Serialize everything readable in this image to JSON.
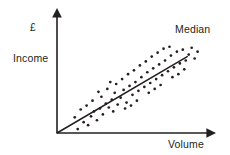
{
  "chart_data": {
    "type": "scatter",
    "title": "",
    "xlabel": "Volume",
    "ylabel": "Income",
    "ylabel_unit": "£",
    "annotations": [
      {
        "name": "median-line-label",
        "text": "Median"
      }
    ],
    "axis_style": "arrow",
    "grid": false,
    "legend": "none",
    "xlim": [
      0,
      100
    ],
    "ylim": [
      0,
      100
    ],
    "trendline": {
      "name": "Median",
      "type": "line",
      "x": [
        0,
        88
      ],
      "y": [
        0,
        78
      ]
    },
    "points": [
      {
        "x": 14,
        "y": 4
      },
      {
        "x": 18,
        "y": 11
      },
      {
        "x": 21,
        "y": 8
      },
      {
        "x": 23,
        "y": 17
      },
      {
        "x": 25,
        "y": 22
      },
      {
        "x": 27,
        "y": 13
      },
      {
        "x": 12,
        "y": 16
      },
      {
        "x": 16,
        "y": 24
      },
      {
        "x": 20,
        "y": 28
      },
      {
        "x": 29,
        "y": 25
      },
      {
        "x": 31,
        "y": 19
      },
      {
        "x": 33,
        "y": 30
      },
      {
        "x": 24,
        "y": 33
      },
      {
        "x": 30,
        "y": 37
      },
      {
        "x": 35,
        "y": 26
      },
      {
        "x": 37,
        "y": 34
      },
      {
        "x": 39,
        "y": 41
      },
      {
        "x": 41,
        "y": 29
      },
      {
        "x": 34,
        "y": 45
      },
      {
        "x": 43,
        "y": 36
      },
      {
        "x": 45,
        "y": 44
      },
      {
        "x": 47,
        "y": 31
      },
      {
        "x": 40,
        "y": 50
      },
      {
        "x": 49,
        "y": 48
      },
      {
        "x": 51,
        "y": 39
      },
      {
        "x": 44,
        "y": 55
      },
      {
        "x": 53,
        "y": 52
      },
      {
        "x": 55,
        "y": 43
      },
      {
        "x": 48,
        "y": 60
      },
      {
        "x": 57,
        "y": 57
      },
      {
        "x": 59,
        "y": 47
      },
      {
        "x": 52,
        "y": 64
      },
      {
        "x": 61,
        "y": 62
      },
      {
        "x": 63,
        "y": 51
      },
      {
        "x": 56,
        "y": 69
      },
      {
        "x": 65,
        "y": 66
      },
      {
        "x": 67,
        "y": 55
      },
      {
        "x": 60,
        "y": 73
      },
      {
        "x": 69,
        "y": 70
      },
      {
        "x": 71,
        "y": 59
      },
      {
        "x": 64,
        "y": 78
      },
      {
        "x": 73,
        "y": 74
      },
      {
        "x": 75,
        "y": 63
      },
      {
        "x": 68,
        "y": 82
      },
      {
        "x": 77,
        "y": 79
      },
      {
        "x": 79,
        "y": 67
      },
      {
        "x": 72,
        "y": 86
      },
      {
        "x": 81,
        "y": 83
      },
      {
        "x": 83,
        "y": 71
      },
      {
        "x": 76,
        "y": 88
      },
      {
        "x": 85,
        "y": 85
      },
      {
        "x": 87,
        "y": 74
      },
      {
        "x": 89,
        "y": 80
      },
      {
        "x": 91,
        "y": 87
      },
      {
        "x": 93,
        "y": 76
      },
      {
        "x": 95,
        "y": 83
      },
      {
        "x": 38,
        "y": 22
      },
      {
        "x": 46,
        "y": 25
      },
      {
        "x": 54,
        "y": 33
      },
      {
        "x": 62,
        "y": 41
      },
      {
        "x": 70,
        "y": 49
      },
      {
        "x": 78,
        "y": 57
      },
      {
        "x": 86,
        "y": 65
      },
      {
        "x": 28,
        "y": 42
      },
      {
        "x": 36,
        "y": 52
      },
      {
        "x": 50,
        "y": 28
      },
      {
        "x": 66,
        "y": 45
      },
      {
        "x": 82,
        "y": 60
      }
    ],
    "colors": {
      "axis": "#231f20",
      "point": "#231f20",
      "trendline": "#231f20",
      "background": "#ffffff"
    }
  }
}
